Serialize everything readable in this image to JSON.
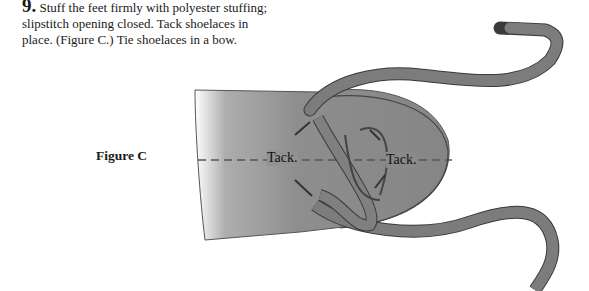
{
  "instruction": {
    "step_number": "9.",
    "text": "Stuff the feet firmly with polyester stuffing; slipstitch opening closed. Tack shoelaces in place. (Figure C.) Tie shoelaces in a bow."
  },
  "figure": {
    "label": "Figure C",
    "annotations": [
      "Tack.",
      "Tack."
    ]
  },
  "colors": {
    "fabric": "#8a8a8a",
    "lace": "#7c7c7c",
    "outline": "#3a3a3a"
  }
}
